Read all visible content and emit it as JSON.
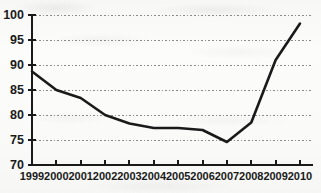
{
  "chart_data": {
    "type": "line",
    "title": "",
    "subtitle": "",
    "xlabel": "",
    "ylabel": "",
    "categories": [
      "1999",
      "2000",
      "2001",
      "2002",
      "2003",
      "2004",
      "2005",
      "2006",
      "2007",
      "2008",
      "2009",
      "2010"
    ],
    "values": [
      88.7,
      85.0,
      83.4,
      80.0,
      78.3,
      77.4,
      77.4,
      77.0,
      74.6,
      78.5,
      91.0,
      98.3
    ],
    "series": [
      {
        "name": "series-1",
        "values": [
          88.7,
          85.0,
          83.4,
          80.0,
          78.3,
          77.4,
          77.4,
          77.0,
          74.6,
          78.5,
          91.0,
          98.3
        ]
      }
    ],
    "ylim": [
      70,
      100
    ],
    "yticks": [
      70,
      75,
      80,
      85,
      90,
      95,
      100
    ],
    "ytick_labels": [
      "70",
      "75",
      "80",
      "85",
      "90",
      "95",
      "100"
    ],
    "xtick_labels": [
      "1999",
      "2000",
      "2001",
      "2002",
      "2003",
      "2004",
      "2005",
      "2006",
      "2007",
      "2008",
      "2009",
      "2010"
    ],
    "grid": true,
    "grid_style": "dotted",
    "grid_axis": "y",
    "legend": false,
    "legend_position": "none",
    "annotations": [],
    "colors": {
      "line": "#1a1a1a",
      "axis": "#1a1a1a",
      "grid": "#8a8a8a",
      "background": "#fbfbfa",
      "text": "#1a1a1a"
    }
  }
}
